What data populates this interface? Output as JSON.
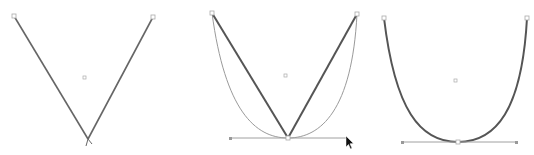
{
  "canvas": {
    "background": "#ffffff"
  },
  "colors": {
    "path_stroke": "#666666",
    "guide_stroke": "#9a9a9a",
    "handle_line": "#a0a0a0",
    "anchor_fill": "#ffffff",
    "anchor_stroke": "#999999",
    "center_point": "#aaaaaa",
    "cursor": "#111111"
  },
  "panels": [
    {
      "id": "corner-v",
      "description": "V shape with sharp corner anchor point",
      "state": "corner-point"
    },
    {
      "id": "converting",
      "description": "V shape being converted to smooth point while dragging handle; curve preview shown",
      "state": "dragging-handle"
    },
    {
      "id": "smooth-u",
      "description": "Resulting U-shaped curve with smooth anchor point and horizontal handles",
      "state": "smooth-point"
    }
  ],
  "cursor": {
    "icon": "arrow-pointer-icon"
  }
}
